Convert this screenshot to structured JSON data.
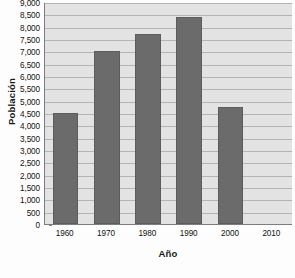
{
  "chart_data": {
    "type": "bar",
    "title": "",
    "subtitle": "",
    "xlabel": "Año",
    "ylabel": "Población",
    "categories": [
      "1960",
      "1970",
      "1980",
      "1990",
      "2000",
      "2010"
    ],
    "values": [
      4500,
      7000,
      7700,
      8400,
      4750,
      null
    ],
    "series": [
      {
        "name": "Población",
        "values": [
          4500,
          7000,
          7700,
          8400,
          4750,
          null
        ]
      }
    ],
    "ylim": [
      0,
      9000
    ],
    "ytick_step": 500,
    "ytick_labels": [
      "9,000",
      "8,500",
      "8,000",
      "7,500",
      "7,000",
      "6,500",
      "6,000",
      "5,500",
      "5,000",
      "4,500",
      "4,000",
      "3,500",
      "3,000",
      "2,500",
      "2,000",
      "1,500",
      "1,000",
      "500",
      "0"
    ],
    "ytick_values": [
      9000,
      8500,
      8000,
      7500,
      7000,
      6500,
      6000,
      5500,
      5000,
      4500,
      4000,
      3500,
      3000,
      2500,
      2000,
      1500,
      1000,
      500,
      0
    ],
    "grid": true,
    "grid_axis": "y",
    "legend": false,
    "legend_position": "none",
    "bar_color": "#6b6b6b",
    "plot_background": "#e3e3e3",
    "gridline_color": "#b4b4b4",
    "axis_color": "#7d7d7d",
    "annotations": []
  }
}
